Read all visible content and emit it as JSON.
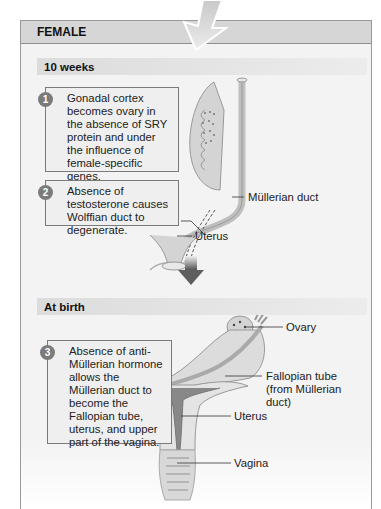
{
  "panel": {
    "title": "FEMALE"
  },
  "stages": [
    {
      "label": "10 weeks",
      "callouts": [
        {
          "number": "1",
          "text": "Gonadal cortex becomes ovary in the absence of SRY protein and under the influence of female-specific genes."
        },
        {
          "number": "2",
          "text": "Absence of testosterone causes Wolffian duct to degenerate."
        }
      ],
      "labels": [
        "Müllerian duct",
        "Uterus"
      ]
    },
    {
      "label": "At birth",
      "callouts": [
        {
          "number": "3",
          "text": "Absence of anti-Müllerian hormone allows the Müllerian duct to become the Fallopian tube, uterus, and upper part of the vagina."
        }
      ],
      "labels": [
        "Ovary",
        "Fallopian tube (from Müllerian duct)",
        "Uterus",
        "Vagina"
      ]
    }
  ],
  "colors": {
    "header_band": "#d6d6d6",
    "panel_bg": "#f3f3f3",
    "arrow": "#d9d9d9",
    "down_arrow": "#6a6a6a",
    "badge": "#7b7b7b"
  }
}
